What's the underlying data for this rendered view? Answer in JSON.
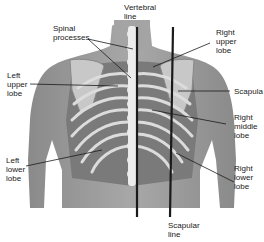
{
  "diagram": {
    "labels": {
      "vertebral_line": "Vertebral\nline",
      "spinal_processes": "Spinal\nprocesses",
      "right_upper_lobe": "Right\nupper\nlobe",
      "left_upper_lobe": "Left\nupper\nlobe",
      "scapula": "Scapula",
      "right_middle_lobe": "Right\nmiddle\nlobe",
      "left_lower_lobe": "Left\nlower\nlobe",
      "right_lower_lobe": "Right\nlower\nlobe",
      "scapular_line": "Scapular\nline"
    },
    "colors": {
      "skin": "#9a9a9a",
      "skin_light": "#b8b8b8",
      "bone": "#e8e8e8",
      "lung_dark": "#6e6e6e",
      "line": "#1a1a1a",
      "label_text": "#1a1a1a"
    }
  }
}
